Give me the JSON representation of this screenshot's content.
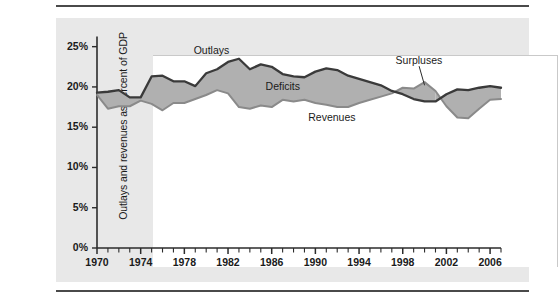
{
  "chart_data": {
    "type": "area",
    "title": "",
    "subtitle": "",
    "xlabel": "",
    "ylabel": "Outlays and revenues as percent of GDP",
    "xlim": [
      1970,
      2007
    ],
    "ylim": [
      0,
      26
    ],
    "ytick_values": [
      0,
      5,
      10,
      15,
      20,
      25
    ],
    "ytick_labels": [
      "0%",
      "5%",
      "10%",
      "15%",
      "20%",
      "25%"
    ],
    "xtick_labels": [
      "1970",
      "1974",
      "1978",
      "1982",
      "1986",
      "1990",
      "1994",
      "1998",
      "2002",
      "2006"
    ],
    "xtick_values": [
      1970,
      1974,
      1978,
      1982,
      1986,
      1990,
      1994,
      1998,
      2002,
      2006
    ],
    "minor_xticks_every": 1,
    "grid": false,
    "legend_position": "inline-annotations",
    "annotations": [
      {
        "text": "Outlays",
        "x": 1980.5,
        "y": 24.4
      },
      {
        "text": "Deficits",
        "x": 1987.0,
        "y": 20.0
      },
      {
        "text": "Revenues",
        "x": 1991.5,
        "y": 16.2
      },
      {
        "text": "Surpluses",
        "x": 1999.5,
        "y": 23.2,
        "leader_to": {
          "x": 2000.0,
          "y": 20.2
        }
      }
    ],
    "x": [
      1970,
      1971,
      1972,
      1973,
      1974,
      1975,
      1976,
      1977,
      1978,
      1979,
      1980,
      1981,
      1982,
      1983,
      1984,
      1985,
      1986,
      1987,
      1988,
      1989,
      1990,
      1991,
      1992,
      1993,
      1994,
      1995,
      1996,
      1997,
      1998,
      1999,
      2000,
      2001,
      2002,
      2003,
      2004,
      2005,
      2006,
      2007
    ],
    "series": [
      {
        "name": "Outlays",
        "color": "#3a3a3a",
        "values": [
          19.3,
          19.4,
          19.6,
          18.7,
          18.7,
          21.3,
          21.4,
          20.7,
          20.7,
          20.1,
          21.7,
          22.2,
          23.1,
          23.5,
          22.2,
          22.8,
          22.5,
          21.6,
          21.3,
          21.2,
          21.9,
          22.3,
          22.1,
          21.4,
          21.0,
          20.6,
          20.2,
          19.5,
          19.1,
          18.5,
          18.2,
          18.2,
          19.1,
          19.7,
          19.6,
          19.9,
          20.1,
          19.9
        ]
      },
      {
        "name": "Revenues",
        "color": "#8a8a8a",
        "values": [
          19.0,
          17.3,
          17.6,
          17.6,
          18.3,
          17.9,
          17.1,
          18.0,
          18.0,
          18.5,
          19.0,
          19.6,
          19.2,
          17.5,
          17.3,
          17.7,
          17.5,
          18.4,
          18.2,
          18.4,
          18.0,
          17.8,
          17.5,
          17.5,
          18.0,
          18.4,
          18.8,
          19.2,
          19.9,
          19.8,
          20.6,
          19.5,
          17.6,
          16.2,
          16.1,
          17.3,
          18.4,
          18.5
        ]
      }
    ],
    "fills": [
      {
        "name": "Deficits",
        "where": "outlays_above_revenues",
        "color": "#b0b0b0"
      },
      {
        "name": "Surpluses",
        "where": "revenues_above_outlays",
        "color": "#b0b0b0"
      }
    ]
  }
}
